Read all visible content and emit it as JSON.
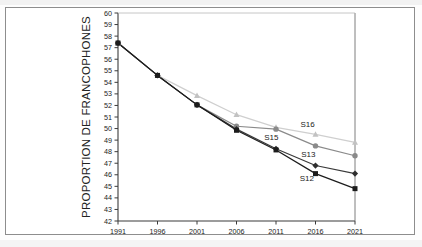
{
  "chart_data": {
    "type": "line",
    "title": "",
    "xlabel": "",
    "ylabel": "PROPORTION DE FRANCOPHONES",
    "x": [
      1991,
      1996,
      2001,
      2006,
      2011,
      2016,
      2021
    ],
    "xtick_labels": [
      "1991",
      "1996",
      "2001",
      "2006",
      "2011",
      "2016",
      "2021"
    ],
    "ylim": [
      42,
      60
    ],
    "xlim": [
      1991,
      2021
    ],
    "ytick_labels": [
      "42",
      "43",
      "44",
      "45",
      "46",
      "47",
      "48",
      "49",
      "50",
      "51",
      "52",
      "53",
      "54",
      "55",
      "56",
      "57",
      "58",
      "59",
      "60"
    ],
    "yticks": [
      42,
      43,
      44,
      45,
      46,
      47,
      48,
      49,
      50,
      51,
      52,
      53,
      54,
      55,
      56,
      57,
      58,
      59,
      60
    ],
    "grid": false,
    "legend_position": "inline-annotations",
    "series": [
      {
        "name": "S12",
        "label": "S12",
        "marker": "square",
        "color": "#1c1c1c",
        "line_color": "#1c1c1c",
        "values": [
          57.4,
          54.6,
          52.05,
          49.85,
          48.15,
          46.1,
          44.8
        ]
      },
      {
        "name": "S13",
        "label": "S13",
        "marker": "diamond",
        "color": "#2e2e2e",
        "line_color": "#3a3a3a",
        "values": [
          57.4,
          54.6,
          52.05,
          49.95,
          48.25,
          46.8,
          46.1
        ]
      },
      {
        "name": "S15",
        "label": "S15",
        "marker": "circle",
        "color": "#8a8a8a",
        "line_color": "#8a8a8a",
        "values": [
          57.4,
          54.6,
          52.05,
          50.2,
          49.95,
          48.5,
          47.65
        ]
      },
      {
        "name": "S16",
        "label": "S16",
        "marker": "triangle",
        "color": "#c2c2c2",
        "line_color": "#cfcfcf",
        "values": [
          57.4,
          54.6,
          52.85,
          51.2,
          50.1,
          49.5,
          48.8
        ]
      }
    ],
    "annotations": [
      {
        "text": "S16",
        "x": 2015.0,
        "y": 50.15
      },
      {
        "text": "S15",
        "x": 2010.4,
        "y": 49.05
      },
      {
        "text": "S13",
        "x": 2015.1,
        "y": 47.55
      },
      {
        "text": "S12",
        "x": 2014.9,
        "y": 45.45
      }
    ]
  }
}
